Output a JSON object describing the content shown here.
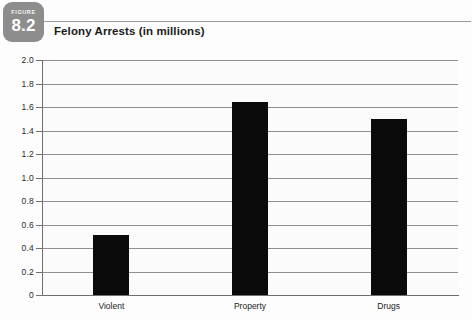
{
  "figure": {
    "kicker": "FIGURE",
    "number": "8.2"
  },
  "title": "Felony Arrests (in millions)",
  "colors": {
    "badge": "#8d8d8d",
    "bar": "#0a0a0a",
    "gridline": "#8f8f8f",
    "axis": "#6f6f6f",
    "plot_background": "#fbfbfb",
    "page_background": "#fdfdfd"
  },
  "chart_data": {
    "type": "bar",
    "title": "Felony Arrests (in millions)",
    "xlabel": "",
    "ylabel": "",
    "categories": [
      "Violent",
      "Property",
      "Drugs"
    ],
    "values": [
      0.51,
      1.64,
      1.5
    ],
    "ylim": [
      0,
      2.0
    ],
    "ytick_step": 0.2,
    "ytick_labels": [
      "2.0",
      "1.8",
      "1.6",
      "1.4",
      "1.2",
      "1.0",
      "0.8",
      "0.6",
      "0.4",
      "0.2",
      "0"
    ],
    "ytick_values": [
      2.0,
      1.8,
      1.6,
      1.4,
      1.2,
      1.0,
      0.8,
      0.6,
      0.4,
      0.2,
      0
    ],
    "grid": true,
    "legend": false,
    "legend_position": "none",
    "bar_color": "#0a0a0a",
    "units": "millions"
  }
}
